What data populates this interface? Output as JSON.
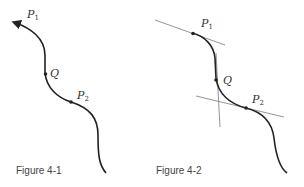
{
  "figures": [
    {
      "caption": "Figure 4-1",
      "points": [
        {
          "name": "P",
          "sub": "1"
        },
        {
          "name": "Q",
          "sub": ""
        },
        {
          "name": "P",
          "sub": "2"
        }
      ]
    },
    {
      "caption": "Figure 4-2",
      "points": [
        {
          "name": "P",
          "sub": "1"
        },
        {
          "name": "Q",
          "sub": ""
        },
        {
          "name": "P",
          "sub": "2"
        }
      ]
    }
  ],
  "colors": {
    "curve": "#222222",
    "tangent": "#555555",
    "text": "#333333"
  }
}
